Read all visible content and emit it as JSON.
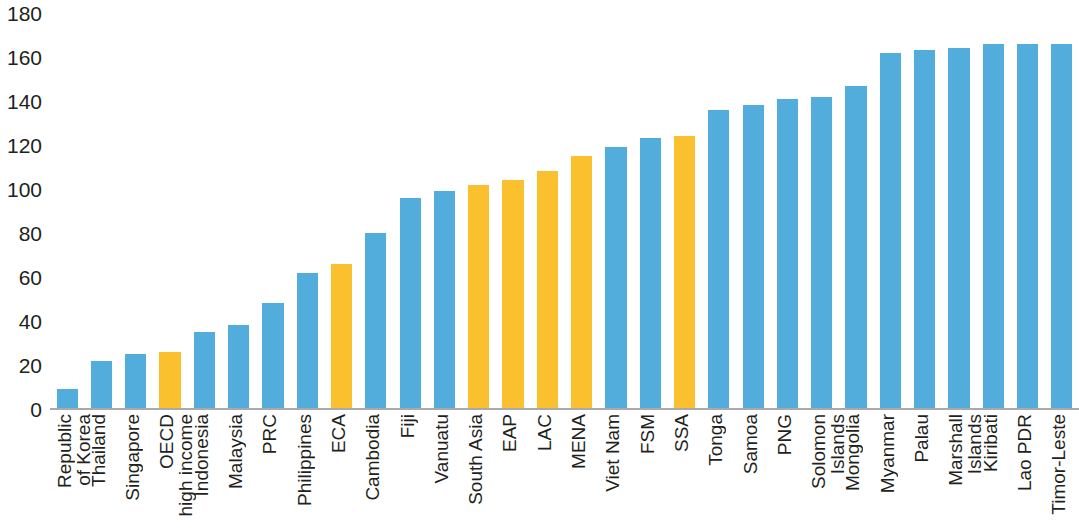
{
  "chart_data": {
    "type": "bar",
    "title": "",
    "subtitle": "",
    "xlabel": "",
    "ylabel": "",
    "ylim": [
      0,
      180
    ],
    "ytick_step": 20,
    "yticks": [
      180,
      160,
      140,
      120,
      100,
      80,
      60,
      40,
      20,
      0
    ],
    "grid": false,
    "legend": null,
    "colors": {
      "bar_blue": "#52ACDC",
      "bar_orange": "#FBC02D",
      "axis_line": "#A7A9AC",
      "text": "#231F20",
      "background": "#FFFFFF"
    },
    "categories": [
      "Republic of Korea",
      "Thailand",
      "Singapore",
      "OECD high income",
      "Indonesia",
      "Malaysia",
      "PRC",
      "Philippines",
      "ECA",
      "Cambodia",
      "Fiji",
      "Vanuatu",
      "South Asia",
      "EAP",
      "LAC",
      "MENA",
      "Viet Nam",
      "FSM",
      "SSA",
      "Tonga",
      "Samoa",
      "PNG",
      "Solomon Islands",
      "Mongolia",
      "Myanmar",
      "Palau",
      "Marshall Islands",
      "Kiribati",
      "Lao PDR",
      "Timor-Leste"
    ],
    "category_lines": [
      [
        "Republic",
        "of Korea"
      ],
      [
        "Thailand"
      ],
      [
        "Singapore"
      ],
      [
        "OECD",
        "high income"
      ],
      [
        "Indonesia"
      ],
      [
        "Malaysia"
      ],
      [
        "PRC"
      ],
      [
        "Philippines"
      ],
      [
        "ECA"
      ],
      [
        "Cambodia"
      ],
      [
        "Fiji"
      ],
      [
        "Vanuatu"
      ],
      [
        "South Asia"
      ],
      [
        "EAP"
      ],
      [
        "LAC"
      ],
      [
        "MENA"
      ],
      [
        "Viet Nam"
      ],
      [
        "FSM"
      ],
      [
        "SSA"
      ],
      [
        "Tonga"
      ],
      [
        "Samoa"
      ],
      [
        "PNG"
      ],
      [
        "Solomon",
        "Islands"
      ],
      [
        "Mongolia"
      ],
      [
        "Myanmar"
      ],
      [
        "Palau"
      ],
      [
        "Marshall",
        "Islands"
      ],
      [
        "Kiribati"
      ],
      [
        "Lao PDR"
      ],
      [
        "Timor-Leste"
      ]
    ],
    "values": [
      9,
      22,
      25,
      26,
      35,
      38,
      48,
      62,
      66,
      80,
      96,
      99,
      102,
      104,
      108,
      115,
      119,
      123,
      124,
      136,
      138,
      141,
      142,
      147,
      162,
      163,
      164,
      166,
      166,
      166
    ],
    "bar_colors": [
      "blue",
      "blue",
      "blue",
      "orange",
      "blue",
      "blue",
      "blue",
      "blue",
      "orange",
      "blue",
      "blue",
      "blue",
      "orange",
      "orange",
      "orange",
      "orange",
      "blue",
      "blue",
      "orange",
      "blue",
      "blue",
      "blue",
      "blue",
      "blue",
      "blue",
      "blue",
      "blue",
      "blue",
      "blue",
      "blue"
    ]
  }
}
